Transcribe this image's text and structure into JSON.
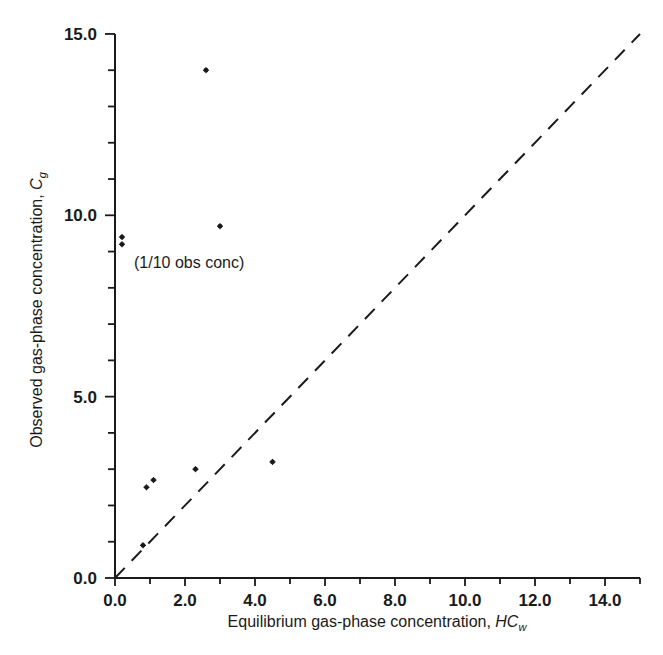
{
  "chart_data": {
    "type": "scatter",
    "title": "",
    "xlabel": "Equilibrium gas-phase concentration, HCw",
    "xlabel_main": "Equilibrium gas-phase concentration, ",
    "xlabel_var": "HC",
    "xlabel_sub": "w",
    "ylabel": "Observed gas-phase concentration, Cg",
    "ylabel_main": "Observed gas-phase concentration, ",
    "ylabel_var": "C",
    "ylabel_sub": "g",
    "xlim": [
      0,
      15
    ],
    "ylim": [
      0,
      15
    ],
    "x_ticks": [
      "0.0",
      "2.0",
      "4.0",
      "6.0",
      "8.0",
      "10.0",
      "12.0",
      "14.0"
    ],
    "y_ticks": [
      "0.0",
      "5.0",
      "10.0",
      "15.0"
    ],
    "grid": false,
    "legend": null,
    "series": [
      {
        "name": "observations",
        "marker": "asterisk",
        "points": [
          {
            "x": 0.2,
            "y": 9.4
          },
          {
            "x": 0.2,
            "y": 9.2
          },
          {
            "x": 0.8,
            "y": 0.9
          },
          {
            "x": 0.9,
            "y": 2.5
          },
          {
            "x": 1.1,
            "y": 2.7
          },
          {
            "x": 2.3,
            "y": 3.0
          },
          {
            "x": 2.6,
            "y": 14.0
          },
          {
            "x": 3.0,
            "y": 9.7
          },
          {
            "x": 4.5,
            "y": 3.2
          }
        ]
      },
      {
        "name": "1:1 equilibrium line",
        "style": "dashed",
        "points": [
          {
            "x": 0,
            "y": 0
          },
          {
            "x": 15,
            "y": 15
          }
        ]
      }
    ],
    "annotations": [
      {
        "text": "(1/10 obs conc)",
        "x": 0.4,
        "y": 8.7
      }
    ]
  },
  "colors": {
    "ink": "#1a1a1a",
    "background": "#ffffff"
  }
}
